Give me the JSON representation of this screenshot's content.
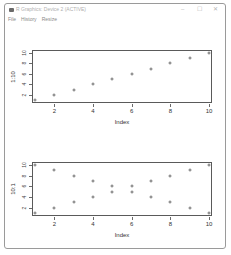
{
  "window": {
    "title": "R Graphics: Device 2 (ACTIVE)",
    "controls": {
      "minimize": "–",
      "maximize": "☐",
      "close": "✕"
    }
  },
  "menu": {
    "items": [
      {
        "label": "File"
      },
      {
        "label": "History"
      },
      {
        "label": "Resize"
      }
    ]
  },
  "chart_data": [
    {
      "type": "scatter",
      "title": "",
      "xlabel": "Index",
      "ylabel": "1:10",
      "x_ticks": [
        2,
        4,
        6,
        8,
        10
      ],
      "y_ticks": [
        2,
        4,
        6,
        8,
        10
      ],
      "xlim": [
        1,
        10
      ],
      "ylim": [
        1,
        10
      ],
      "grid": false,
      "series": [
        {
          "name": "1:10",
          "x": [
            1,
            2,
            3,
            4,
            5,
            6,
            7,
            8,
            9,
            10
          ],
          "y": [
            1,
            2,
            3,
            4,
            5,
            6,
            7,
            8,
            9,
            10
          ]
        }
      ]
    },
    {
      "type": "scatter",
      "title": "",
      "xlabel": "Index",
      "ylabel": "10:1",
      "x_ticks": [
        2,
        4,
        6,
        8,
        10
      ],
      "y_ticks": [
        2,
        4,
        6,
        8,
        10
      ],
      "xlim": [
        1,
        10
      ],
      "ylim": [
        1,
        10
      ],
      "grid": false,
      "series": [
        {
          "name": "ascending",
          "x": [
            1,
            2,
            3,
            4,
            5,
            6,
            7,
            8,
            9,
            10
          ],
          "y": [
            1,
            2,
            3,
            4,
            5,
            6,
            7,
            8,
            9,
            10
          ]
        },
        {
          "name": "descending",
          "x": [
            1,
            2,
            3,
            4,
            5,
            6,
            7,
            8,
            9,
            10
          ],
          "y": [
            10,
            9,
            8,
            7,
            6,
            5,
            4,
            3,
            2,
            1
          ]
        }
      ]
    }
  ]
}
